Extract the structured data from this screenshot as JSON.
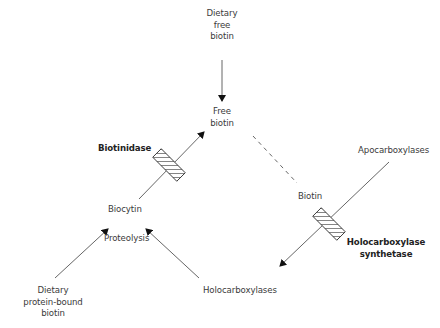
{
  "diagram": {
    "nodes": {
      "dietary_free_biotin": [
        "Dietary",
        "free",
        "biotin"
      ],
      "free_biotin": [
        "Free",
        "biotin"
      ],
      "biotinidase": "Biotinidase",
      "biocytin": "Biocytin",
      "proteolysis": "Proteolysis",
      "dietary_protein_bound_biotin": [
        "Dietary",
        "protein-bound",
        "biotin"
      ],
      "holocarboxylases": "Holocarboxylases",
      "biotin": "Biotin",
      "apocarboxylases": "Apocarboxylases",
      "holocarboxylase_synthetase": [
        "Holocarboxylase",
        "synthetase"
      ]
    },
    "edges": [
      {
        "from": "Dietary free biotin",
        "to": "Free biotin",
        "style": "arrow"
      },
      {
        "from": "Biocytin",
        "to": "Free biotin",
        "style": "arrow",
        "enzyme": "Biotinidase"
      },
      {
        "from": "Free biotin",
        "to": "Biotin",
        "style": "dashed"
      },
      {
        "from": "Apocarboxylases",
        "to": "Holocarboxylases",
        "style": "arrow",
        "enzyme": "Holocarboxylase synthetase"
      },
      {
        "from": "Dietary protein-bound biotin",
        "to": "Biocytin",
        "style": "arrow"
      },
      {
        "from": "Holocarboxylases",
        "to": "Biocytin",
        "style": "arrow",
        "label": "Proteolysis"
      }
    ],
    "colors": {
      "line": "#555555",
      "text": "#3a3a3a"
    }
  }
}
